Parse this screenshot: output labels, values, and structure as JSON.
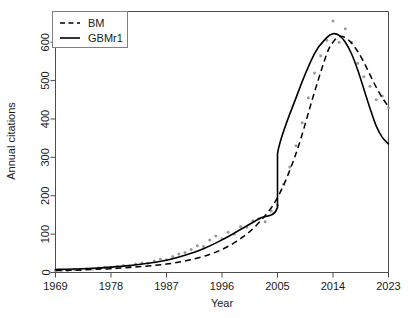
{
  "chart_data": {
    "type": "line",
    "title": "",
    "xlabel": "Year",
    "ylabel": "Annual citations",
    "xlim": [
      1969,
      2023
    ],
    "ylim": [
      0,
      680
    ],
    "xticks": [
      1969,
      1978,
      1987,
      1996,
      2005,
      2014,
      2023
    ],
    "xticklabels": [
      "1969",
      "1978",
      "1987",
      "1996",
      "2005",
      "2014",
      "2023"
    ],
    "yticks": [
      0,
      100,
      200,
      300,
      400,
      500,
      600
    ],
    "yticklabels": [
      "0",
      "100",
      "200",
      "300",
      "400",
      "500",
      "600"
    ],
    "grid": false,
    "legend_position": "top-left",
    "legend": [
      {
        "name": "BM",
        "style": "dashed"
      },
      {
        "name": "GBMr1",
        "style": "solid"
      }
    ],
    "series": [
      {
        "name": "BM",
        "style": "dashed",
        "x": [
          1969,
          1972,
          1975,
          1978,
          1981,
          1984,
          1987,
          1990,
          1993,
          1996,
          1999,
          2002,
          2005,
          2008,
          2011,
          2013,
          2014,
          2015,
          2016,
          2017,
          2018,
          2019,
          2020,
          2021,
          2022,
          2023
        ],
        "values": [
          5,
          6,
          8,
          10,
          13,
          17,
          22,
          30,
          42,
          60,
          88,
          130,
          195,
          310,
          470,
          570,
          600,
          615,
          612,
          598,
          576,
          548,
          515,
          483,
          455,
          432
        ]
      },
      {
        "name": "GBMr1",
        "style": "solid",
        "x": [
          1969,
          1972,
          1975,
          1978,
          1981,
          1984,
          1987,
          1990,
          1993,
          1996,
          1999,
          2002,
          2005,
          2005,
          2008,
          2011,
          2013,
          2014,
          2015,
          2016,
          2017,
          2018,
          2019,
          2020,
          2021,
          2022,
          2023
        ],
        "values": [
          8,
          9,
          11,
          14,
          18,
          24,
          32,
          45,
          62,
          85,
          112,
          140,
          170,
          310,
          455,
          570,
          612,
          622,
          618,
          600,
          570,
          528,
          478,
          428,
          382,
          352,
          335
        ]
      }
    ],
    "scatter": {
      "name": "observed-citations",
      "color": "#9a9a9a",
      "x": [
        1969,
        1970,
        1971,
        1972,
        1973,
        1974,
        1975,
        1976,
        1977,
        1978,
        1979,
        1980,
        1981,
        1982,
        1983,
        1984,
        1985,
        1986,
        1987,
        1988,
        1989,
        1990,
        1991,
        1992,
        1993,
        1994,
        1995,
        1996,
        1997,
        1998,
        1999,
        2000,
        2001,
        2002,
        2003,
        2004,
        2005,
        2006,
        2007,
        2008,
        2009,
        2010,
        2011,
        2012,
        2013,
        2014,
        2015,
        2016,
        2017,
        2018,
        2019,
        2020,
        2021,
        2022,
        2023
      ],
      "values": [
        5,
        6,
        5,
        8,
        7,
        10,
        9,
        12,
        14,
        13,
        16,
        18,
        17,
        22,
        25,
        24,
        30,
        35,
        33,
        42,
        48,
        52,
        60,
        70,
        68,
        85,
        95,
        88,
        105,
        100,
        120,
        118,
        135,
        140,
        132,
        160,
        175,
        230,
        275,
        330,
        390,
        455,
        520,
        565,
        605,
        655,
        600,
        635,
        600,
        545,
        510,
        485,
        450,
        460,
        430
      ]
    }
  }
}
